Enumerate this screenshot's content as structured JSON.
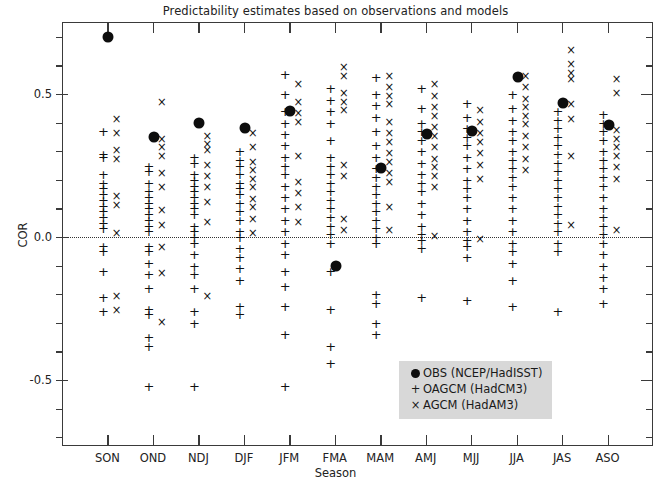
{
  "chart_data": {
    "type": "scatter",
    "title": "Predictability estimates based on observations and models",
    "xlabel": "Season",
    "ylabel": "COR",
    "ylim": [
      -0.75,
      0.8
    ],
    "ytick_labels": [
      "0.5",
      "0.0",
      "-0.5"
    ],
    "ytick_values": [
      0.5,
      0.0,
      -0.5
    ],
    "ytick_minor_step": 0.1,
    "grid": false,
    "zero_reference_line": 0.0,
    "legend_position": "bottom-right",
    "categories": [
      "SON",
      "OND",
      "NDJ",
      "DJF",
      "JFM",
      "FMA",
      "MAM",
      "AMJ",
      "MJJ",
      "JJA",
      "JAS",
      "ASO"
    ],
    "series": [
      {
        "name": "OBS (NCEP/HadISST)",
        "marker": "filled-circle",
        "color": "#0d0d0d",
        "values": [
          0.7,
          0.35,
          0.4,
          0.38,
          0.44,
          -0.1,
          0.24,
          0.36,
          0.37,
          0.56,
          0.47,
          0.39
        ]
      },
      {
        "name": "OAGCM (HadCM3)",
        "marker": "plus",
        "color": "#111111",
        "values_by_category": {
          "SON": [
            0.37,
            0.29,
            0.28,
            0.22,
            0.19,
            0.17,
            0.15,
            0.13,
            0.11,
            0.09,
            0.07,
            0.05,
            0.03,
            -0.03,
            -0.05,
            -0.12,
            -0.21,
            -0.26
          ],
          "OND": [
            0.25,
            0.23,
            0.19,
            0.16,
            0.14,
            0.12,
            0.1,
            0.08,
            0.06,
            0.04,
            0.02,
            -0.03,
            -0.05,
            -0.09,
            -0.13,
            -0.18,
            -0.25,
            -0.27,
            -0.35,
            -0.38,
            -0.52
          ],
          "NDJ": [
            0.28,
            0.26,
            0.22,
            0.2,
            0.18,
            0.16,
            0.14,
            0.12,
            0.1,
            0.08,
            0.04,
            0.02,
            0.0,
            -0.02,
            -0.06,
            -0.1,
            -0.13,
            -0.18,
            -0.26,
            -0.3,
            -0.52
          ],
          "DJF": [
            0.3,
            0.27,
            0.25,
            0.22,
            0.19,
            0.17,
            0.15,
            0.12,
            0.09,
            0.06,
            0.02,
            0.0,
            -0.04,
            -0.07,
            -0.11,
            -0.15,
            -0.24,
            -0.27
          ],
          "JFM": [
            0.57,
            0.5,
            0.44,
            0.4,
            0.36,
            0.32,
            0.28,
            0.25,
            0.22,
            0.18,
            0.14,
            0.1,
            0.06,
            0.02,
            -0.02,
            -0.06,
            -0.12,
            -0.17,
            -0.24,
            -0.34,
            -0.52
          ],
          "FMA": [
            0.52,
            0.48,
            0.44,
            0.4,
            0.34,
            0.28,
            0.25,
            0.22,
            0.19,
            0.16,
            0.13,
            0.1,
            0.07,
            0.04,
            0.01,
            -0.02,
            -0.12,
            -0.25,
            -0.38,
            -0.44
          ],
          "MAM": [
            0.56,
            0.5,
            0.46,
            0.42,
            0.37,
            0.32,
            0.28,
            0.24,
            0.21,
            0.18,
            0.15,
            0.12,
            0.09,
            0.06,
            0.03,
            0.0,
            -0.02,
            -0.2,
            -0.23,
            -0.3,
            -0.34
          ],
          "AMJ": [
            0.52,
            0.45,
            0.4,
            0.37,
            0.34,
            0.3,
            0.26,
            0.22,
            0.19,
            0.16,
            0.12,
            0.08,
            0.04,
            0.01,
            -0.01,
            -0.04,
            -0.21
          ],
          "MJJ": [
            0.47,
            0.42,
            0.38,
            0.35,
            0.32,
            0.28,
            0.24,
            0.2,
            0.17,
            0.14,
            0.1,
            0.06,
            0.02,
            -0.01,
            -0.03,
            -0.07,
            -0.22
          ],
          "JJA": [
            0.5,
            0.45,
            0.41,
            0.37,
            0.34,
            0.3,
            0.27,
            0.24,
            0.21,
            0.18,
            0.14,
            0.1,
            0.06,
            0.02,
            -0.02,
            -0.05,
            -0.09,
            -0.15,
            -0.24
          ],
          "JAS": [
            0.44,
            0.41,
            0.38,
            0.35,
            0.32,
            0.29,
            0.26,
            0.23,
            0.2,
            0.17,
            0.14,
            0.11,
            0.08,
            0.05,
            0.02,
            -0.02,
            -0.05,
            -0.26
          ],
          "ASO": [
            0.43,
            0.4,
            0.37,
            0.34,
            0.3,
            0.27,
            0.24,
            0.21,
            0.18,
            0.14,
            0.1,
            0.07,
            0.04,
            0.01,
            -0.02,
            -0.06,
            -0.1,
            -0.14,
            -0.18,
            -0.23
          ]
        }
      },
      {
        "name": "AGCM (HadAM3)",
        "marker": "x-cross",
        "color": "#111111",
        "values_by_category": {
          "SON": [
            0.41,
            0.36,
            0.3,
            0.27,
            0.14,
            0.11,
            0.01,
            -0.21,
            -0.26
          ],
          "OND": [
            0.47,
            0.34,
            0.31,
            0.28,
            0.22,
            0.17,
            0.09,
            0.04,
            -0.04,
            -0.13,
            -0.3
          ],
          "NDJ": [
            0.35,
            0.32,
            0.3,
            0.25,
            0.21,
            0.17,
            0.12,
            0.05,
            -0.21
          ],
          "DJF": [
            0.36,
            0.31,
            0.26,
            0.23,
            0.2,
            0.17,
            0.13,
            0.1,
            0.06,
            0.01
          ],
          "JFM": [
            0.53,
            0.47,
            0.43,
            0.4,
            0.28,
            0.19,
            0.15,
            0.1,
            0.05
          ],
          "FMA": [
            0.59,
            0.56,
            0.5,
            0.47,
            0.44,
            0.25,
            0.21,
            0.06,
            0.02
          ],
          "MAM": [
            0.56,
            0.52,
            0.49,
            0.46,
            0.4,
            0.36,
            0.33,
            0.29,
            0.26,
            0.22,
            0.19,
            0.1,
            0.02
          ],
          "AMJ": [
            0.53,
            0.49,
            0.45,
            0.42,
            0.38,
            0.35,
            0.31,
            0.27,
            0.24,
            0.21,
            0.17,
            0.0
          ],
          "MJJ": [
            0.44,
            0.4,
            0.36,
            0.33,
            0.29,
            0.25,
            0.2,
            -0.01
          ],
          "JJA": [
            0.56,
            0.52,
            0.48,
            0.45,
            0.42,
            0.39,
            0.35,
            0.31,
            0.27,
            0.23
          ],
          "JAS": [
            0.65,
            0.6,
            0.57,
            0.55,
            0.46,
            0.41,
            0.28,
            0.04
          ],
          "ASO": [
            0.55,
            0.5,
            0.37,
            0.34,
            0.31,
            0.28,
            0.24,
            0.2,
            0.02
          ]
        }
      }
    ]
  },
  "legend": {
    "items": [
      {
        "symbol": "filled-circle",
        "label": "OBS (NCEP/HadISST)"
      },
      {
        "symbol": "plus",
        "label": "OAGCM (HadCM3)"
      },
      {
        "symbol": "x-cross",
        "label": "AGCM (HadAM3)"
      }
    ]
  }
}
